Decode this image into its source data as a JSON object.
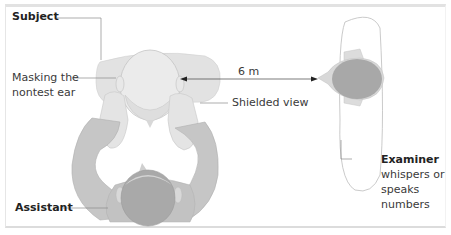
{
  "diagram": {
    "type": "hearing-test-setup",
    "labels": {
      "subject": "Subject",
      "masking": [
        "Masking the",
        "nontest ear"
      ],
      "distance": "6 m",
      "shielded": "Shielded view",
      "assistant": "Assistant",
      "examiner_title": "Examiner",
      "examiner_desc": [
        "whispers or",
        "speaks",
        "numbers"
      ]
    },
    "colors": {
      "border": "#e0e0e0",
      "light_figure": "#e6e6e6",
      "mid_figure": "#c8c8c8",
      "dark_head": "#a8a8a8",
      "leader_line": "#8a8a8a",
      "text": "#333333"
    }
  }
}
